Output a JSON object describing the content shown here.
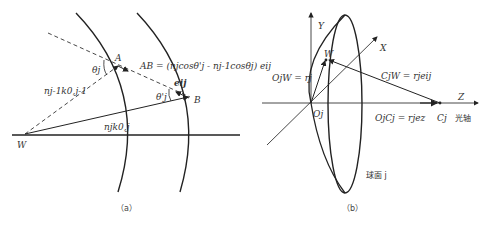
{
  "panel_a": {
    "caption": "（a）",
    "labels": {
      "A": "A",
      "B": "B",
      "W": "W",
      "theta_j": "θj",
      "theta_j_prime": "θ'j",
      "e_ij": "eij",
      "n_prev_k": "nj-1k0,j-1",
      "n_k": "njk0,j",
      "AB_eq": "AB = (njcosθ'j - nj-1cosθj) eij"
    }
  },
  "panel_b": {
    "caption": "（b）",
    "labels": {
      "Y": "Y",
      "X": "X",
      "Z": "Z",
      "W": "W",
      "Oj": "Oj",
      "Cj": "Cj",
      "optical_axis": "光轴",
      "OjW_eq": "OjW = rj",
      "CjW_eq": "CjW = rjeij",
      "OjCj_eq": "OjCj = rjez",
      "surface": "球面 j"
    }
  },
  "colors": {
    "line": "#222222",
    "text": "#333333",
    "background": "#ffffff"
  }
}
